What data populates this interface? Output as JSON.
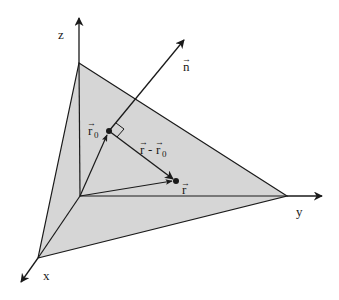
{
  "diagram": {
    "type": "vector-plane-geometry",
    "colors": {
      "plane_fill": "#d6d6d6",
      "line": "#1a1a1a",
      "background": "#ffffff"
    },
    "axes": {
      "z": {
        "label": "z"
      },
      "y": {
        "label": "y"
      },
      "x": {
        "label": "x"
      }
    },
    "vectors": {
      "n": {
        "label": "n",
        "arrow": "→"
      },
      "r0": {
        "label": "r",
        "subscript": "0",
        "arrow": "→"
      },
      "r": {
        "label": "r",
        "arrow": "→"
      },
      "r_minus_r0": {
        "label_a": "r",
        "minus": "-",
        "label_b": "r",
        "subscript": "0",
        "arrow": "→"
      }
    },
    "annotations": {
      "right_angle": "perpendicular marker between n and (r - r0)"
    }
  }
}
